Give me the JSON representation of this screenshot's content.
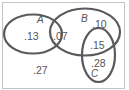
{
  "diagram": {
    "type": "venn",
    "colors": {
      "outline": "#5a5a5a",
      "frame": "#b5b5b5",
      "text": "#555555",
      "background": "#ffffff"
    },
    "sets": [
      {
        "name": "A",
        "label": "A"
      },
      {
        "name": "B",
        "label": "B"
      },
      {
        "name": "C",
        "label": "C"
      }
    ],
    "regions": {
      "a_only": ".13",
      "a_and_b": ".07",
      "b_only": ".10",
      "b_and_c": ".15",
      "c_only": ".28",
      "outside": ".27"
    }
  }
}
